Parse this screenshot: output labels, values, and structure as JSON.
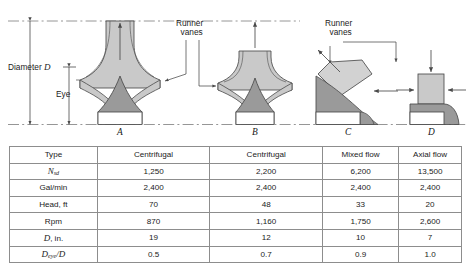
{
  "figure": {
    "annotations": {
      "diameter_label": "Diameter",
      "diameter_symbol": "D",
      "eye_label": "Eye",
      "runner_vanes_left_line1": "Runner",
      "runner_vanes_left_line2": "vanes",
      "runner_vanes_right_line1": "Runner",
      "runner_vanes_right_line2": "vanes"
    },
    "diagram_letters": [
      "A",
      "B",
      "C",
      "D"
    ],
    "colors": {
      "shroud_fill": "#c9c9c9",
      "hub_fill": "#9a9a9a",
      "outline": "#4a4a4a",
      "centerline": "#8a8a8a",
      "table_border": "#8d8d8d",
      "text": "#1b1b1b"
    }
  },
  "table": {
    "columns": [
      "Type",
      "Centrifugal",
      "Centrifugal",
      "Mixed flow",
      "Axial flow"
    ],
    "rows": [
      {
        "label": "N",
        "label_sub": "sd",
        "label_italic": true,
        "values": [
          "1,250",
          "2,200",
          "6,200",
          "13,500"
        ]
      },
      {
        "label": "Gal/min",
        "label_sub": "",
        "label_italic": false,
        "values": [
          "2,400",
          "2,400",
          "2,400",
          "2,400"
        ]
      },
      {
        "label": "Head, ft",
        "label_sub": "",
        "label_italic": false,
        "values": [
          "70",
          "48",
          "33",
          "20"
        ]
      },
      {
        "label": "Rpm",
        "label_sub": "",
        "label_italic": false,
        "values": [
          "870",
          "1,160",
          "1,750",
          "2,600"
        ]
      },
      {
        "label": "D, in.",
        "label_sub": "",
        "label_italic": false,
        "values": [
          "19",
          "12",
          "10",
          "7"
        ]
      },
      {
        "label": "Deye/D",
        "label_sub": "eye",
        "label_italic": true,
        "values": [
          "0.5",
          "0.7",
          "0.9",
          "1.0"
        ]
      }
    ]
  }
}
